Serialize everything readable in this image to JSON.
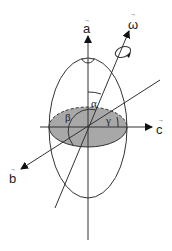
{
  "diagram": {
    "title": "",
    "axes": {
      "a": {
        "label": "a",
        "vector": true
      },
      "b": {
        "label": "b",
        "vector": true
      },
      "c": {
        "label": "c",
        "vector": true
      },
      "omega": {
        "label": "ω",
        "vector": true
      }
    },
    "angles": {
      "alpha": "α",
      "beta": "β",
      "gamma": "γ"
    },
    "vector_arrow_glyph": "→",
    "colors": {
      "stroke": "#333333",
      "shaded_equator": "#a8a8a8",
      "background": "#ffffff"
    }
  }
}
